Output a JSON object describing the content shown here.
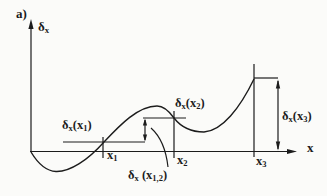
{
  "figure": {
    "panel_label": "a)",
    "colors": {
      "ink": "#1c1c1c",
      "background": "#fbfbf9"
    },
    "axes": {
      "y_label": {
        "parts": [
          {
            "t": "δ"
          },
          {
            "t": "x",
            "sub": true
          }
        ]
      },
      "x_label": {
        "parts": [
          {
            "t": "x"
          }
        ]
      }
    },
    "tick_labels": {
      "x1": {
        "parts": [
          {
            "t": "x"
          },
          {
            "t": "1",
            "sub": true
          }
        ]
      },
      "x2": {
        "parts": [
          {
            "t": "x"
          },
          {
            "t": "2",
            "sub": true
          }
        ]
      },
      "x3": {
        "parts": [
          {
            "t": "x"
          },
          {
            "t": "3",
            "sub": true
          }
        ]
      }
    },
    "value_labels": {
      "delta_x1": {
        "parts": [
          {
            "t": "δ"
          },
          {
            "t": "x",
            "sub": true
          },
          {
            "t": "(x"
          },
          {
            "t": "1",
            "sub": true
          },
          {
            "t": ")"
          }
        ]
      },
      "delta_x2": {
        "parts": [
          {
            "t": "δ"
          },
          {
            "t": "x",
            "sub": true
          },
          {
            "t": "(x"
          },
          {
            "t": "2",
            "sub": true
          },
          {
            "t": ")"
          }
        ]
      },
      "delta_x3": {
        "parts": [
          {
            "t": "δ"
          },
          {
            "t": "x",
            "sub": true
          },
          {
            "t": "(x"
          },
          {
            "t": "3",
            "sub": true
          },
          {
            "t": ")"
          }
        ]
      },
      "delta_x12": {
        "parts": [
          {
            "t": "δ"
          },
          {
            "t": "x",
            "sub": true
          },
          {
            "t": " (x"
          },
          {
            "t": "1,2",
            "sub": true
          },
          {
            "t": ")"
          }
        ]
      }
    }
  }
}
